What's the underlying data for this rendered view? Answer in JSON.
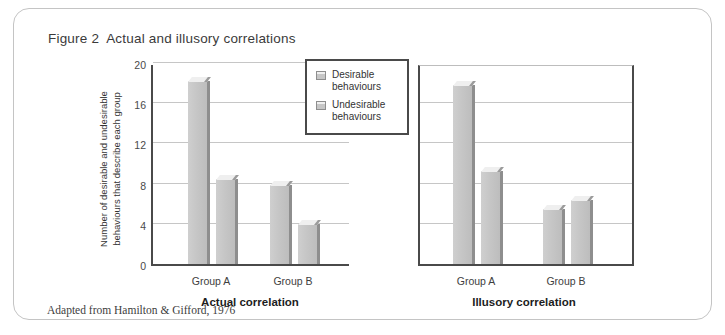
{
  "figure": {
    "number_label": "Figure 2",
    "title": "Actual and illusory correlations",
    "source_note": "Adapted from Hamilton & Gifford, 1976"
  },
  "legend": {
    "items": [
      {
        "label_line1": "Desirable",
        "label_line2": "behaviours",
        "swatch": "gray-bar-swatch"
      },
      {
        "label_line1": "Undesirable",
        "label_line2": "behaviours",
        "swatch": "gray-bar-swatch"
      }
    ]
  },
  "axis": {
    "y_title_line1": "Number of desirable and undesirable",
    "y_title_line2": "behaviours that describe each group",
    "y_ticks": [
      "0",
      "4",
      "8",
      "12",
      "16",
      "20"
    ]
  },
  "panels": {
    "actual": {
      "title": "Actual correlation",
      "categories": [
        "Group A",
        "Group B"
      ]
    },
    "illusory": {
      "title": "Illusory correlation",
      "categories": [
        "Group A",
        "Group B"
      ]
    }
  },
  "colors": {
    "bar_face": "#c6c6c6",
    "bar_top": "#efefef",
    "bar_side": "#8e8e8e",
    "axis": "#4a4a4a",
    "gridline": "#c6c6c6",
    "frame": "#c4c4c4"
  },
  "chart_data": {
    "type": "bar",
    "xlabel": "",
    "ylabel": "Number of desirable and undesirable behaviours that describe each group",
    "ylim": [
      0,
      20
    ],
    "yticks": [
      0,
      4,
      8,
      12,
      16,
      20
    ],
    "grid": true,
    "legend_position": "top-center-between-panels",
    "panels": [
      {
        "name": "Actual correlation",
        "categories": [
          "Group A",
          "Group B"
        ],
        "series": [
          {
            "name": "Desirable behaviours",
            "values": [
              18.2,
              7.9
            ]
          },
          {
            "name": "Undesirable behaviours",
            "values": [
              8.5,
              4.0
            ]
          }
        ]
      },
      {
        "name": "Illusory correlation",
        "categories": [
          "Group A",
          "Group B"
        ],
        "series": [
          {
            "name": "Desirable behaviours",
            "values": [
              17.8,
              5.5
            ]
          },
          {
            "name": "Undesirable behaviours",
            "values": [
              9.3,
              6.4
            ]
          }
        ]
      }
    ]
  }
}
